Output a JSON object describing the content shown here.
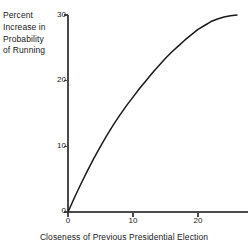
{
  "chart_data": {
    "type": "line",
    "title": "",
    "xlabel": "Closeness of Previous Presidential Election",
    "ylabel": "Percent Increase in Probability of Running",
    "ylabel_lines": [
      "Percent",
      "Increase in",
      "Probability",
      "of Running"
    ],
    "xlim": [
      0,
      26
    ],
    "ylim": [
      0,
      30
    ],
    "xticks": [
      0,
      10,
      20
    ],
    "xticklabels": [
      "0",
      "10",
      "20"
    ],
    "yticks": [
      0,
      10,
      20,
      30
    ],
    "yticklabels": [
      "0",
      "10",
      "20",
      "30"
    ],
    "grid": false,
    "legend": null,
    "series": [
      {
        "name": "Percent increase in probability of running",
        "x": [
          0,
          1,
          2,
          3,
          4,
          5,
          6,
          7,
          8,
          9,
          10,
          11,
          12,
          13,
          14,
          15,
          16,
          17,
          18,
          19,
          20,
          21,
          22,
          23,
          24,
          25,
          26
        ],
        "y": [
          0,
          2.2,
          4.3,
          6.3,
          8.2,
          10.0,
          11.7,
          13.3,
          14.8,
          16.2,
          17.5,
          18.8,
          20.0,
          21.2,
          22.3,
          23.4,
          24.4,
          25.3,
          26.2,
          27.0,
          27.8,
          28.4,
          29.0,
          29.4,
          29.7,
          29.9,
          30.0
        ]
      }
    ]
  },
  "axes": {
    "origin_px": {
      "x": 68,
      "y": 212
    },
    "x_unit_px": 6.5,
    "y_unit_px": 6.567
  },
  "style": {
    "line_color": "#1a1a1a",
    "axis_color": "#4a4a4a",
    "background": "#ffffff",
    "text_color": "#202020"
  }
}
